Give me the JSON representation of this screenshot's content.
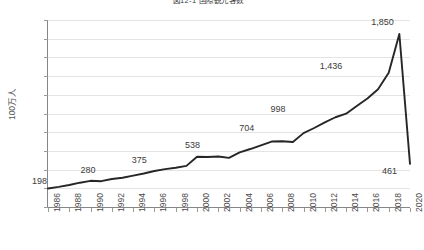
{
  "chart_data": {
    "type": "line",
    "title": "図12-1 国際観光客数",
    "xlabel": "",
    "ylabel": "100万人",
    "ylim": [
      0,
      2000
    ],
    "ystep": 200,
    "grid": true,
    "legend": "none",
    "accent_color": "#262626",
    "grid_color": "#e4e4e4",
    "axis_color": "#868686",
    "y_ticks": [
      "2,000",
      "1,800",
      "1,600",
      "1,400",
      "1,200",
      "1,000",
      "800",
      "600",
      "400",
      "200",
      "0"
    ],
    "x_ticks": [
      "1986",
      "1988",
      "1990",
      "1992",
      "1994",
      "1996",
      "1998",
      "2000",
      "2002",
      "2004",
      "2006",
      "2008",
      "2010",
      "2012",
      "2014",
      "2016",
      "2018",
      "2020"
    ],
    "x": [
      1986,
      1987,
      1988,
      1989,
      1990,
      1991,
      1992,
      1993,
      1994,
      1995,
      1996,
      1997,
      1998,
      1999,
      2000,
      2001,
      2002,
      2003,
      2004,
      2005,
      2006,
      2007,
      2008,
      2009,
      2010,
      2011,
      2012,
      2013,
      2014,
      2015,
      2016,
      2017,
      2018,
      2019,
      2020
    ],
    "values": [
      198,
      215,
      235,
      260,
      280,
      276,
      300,
      313,
      335,
      358,
      385,
      405,
      420,
      440,
      538,
      535,
      540,
      525,
      585,
      620,
      660,
      700,
      704,
      695,
      790,
      845,
      905,
      960,
      998,
      1080,
      1160,
      1260,
      1436,
      1850,
      461
    ],
    "point_labels": [
      {
        "year": 1986,
        "value": 198,
        "text": "198"
      },
      {
        "year": 1990,
        "value": 280,
        "text": "280"
      },
      {
        "year": 1995,
        "value": 375,
        "text": "375"
      },
      {
        "year": 2000,
        "value": 538,
        "text": "538"
      },
      {
        "year": 2005,
        "value": 704,
        "text": "704"
      },
      {
        "year": 2010,
        "value": 998,
        "text": "998"
      },
      {
        "year": 2015,
        "value": 1436,
        "text": "1,436"
      },
      {
        "year": 2019,
        "value": 1850,
        "text": "1,850"
      },
      {
        "year": 2020,
        "value": 461,
        "text": "461"
      }
    ],
    "annotations": []
  }
}
